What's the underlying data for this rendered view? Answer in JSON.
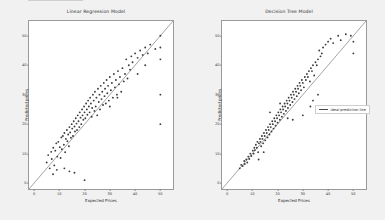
{
  "figure": {
    "background_color": "#f1f1f1",
    "axes_background": "#ffffff",
    "marker_color": "#3b3b3b",
    "line_color": "#555555"
  },
  "panels": [
    {
      "id": "linear-regression",
      "title": "Linear Regression Model",
      "legend_label": "ideal prediction line",
      "legend_position": "upper left"
    },
    {
      "id": "decision-tree",
      "title": "Decision Tree Model",
      "legend_label": "ideal prediction line",
      "legend_position": "center right"
    }
  ],
  "chart_data": [
    {
      "type": "scatter",
      "title": "Linear Regression Model",
      "xlabel": "Expected Prices",
      "ylabel": "Predicted prices",
      "xlim": [
        -2,
        55
      ],
      "ylim": [
        -2,
        55
      ],
      "xticks": [
        0,
        10,
        20,
        30,
        40,
        50
      ],
      "yticks": [
        0,
        10,
        20,
        30,
        40,
        50
      ],
      "grid": false,
      "legend": [
        "ideal prediction line"
      ],
      "legend_position": "upper left",
      "reference_line": {
        "slope": 1,
        "intercept": 0,
        "label": "ideal prediction line"
      },
      "points": [
        [
          5.0,
          7.0
        ],
        [
          5.6,
          9.5
        ],
        [
          6.2,
          5.0
        ],
        [
          6.8,
          10.6
        ],
        [
          7.0,
          8.2
        ],
        [
          7.6,
          12.0
        ],
        [
          8.0,
          6.0
        ],
        [
          8.4,
          11.0
        ],
        [
          8.8,
          13.5
        ],
        [
          9.2,
          9.0
        ],
        [
          9.6,
          14.0
        ],
        [
          10.2,
          12.2
        ],
        [
          10.5,
          8.5
        ],
        [
          10.8,
          15.5
        ],
        [
          11.0,
          11.5
        ],
        [
          11.4,
          16.0
        ],
        [
          11.8,
          13.0
        ],
        [
          12.0,
          17.0
        ],
        [
          12.3,
          10.5
        ],
        [
          12.6,
          15.0
        ],
        [
          13.0,
          18.0
        ],
        [
          13.2,
          14.2
        ],
        [
          13.5,
          16.5
        ],
        [
          13.8,
          12.5
        ],
        [
          14.0,
          19.0
        ],
        [
          14.3,
          17.2
        ],
        [
          14.6,
          15.4
        ],
        [
          14.9,
          20.0
        ],
        [
          15.1,
          18.5
        ],
        [
          15.4,
          16.0
        ],
        [
          15.7,
          21.0
        ],
        [
          16.0,
          19.2
        ],
        [
          16.2,
          17.5
        ],
        [
          16.5,
          22.0
        ],
        [
          16.8,
          20.2
        ],
        [
          17.0,
          18.0
        ],
        [
          17.3,
          23.0
        ],
        [
          17.6,
          21.0
        ],
        [
          17.9,
          19.0
        ],
        [
          18.1,
          24.0
        ],
        [
          18.4,
          22.2
        ],
        [
          18.7,
          20.0
        ],
        [
          19.0,
          25.0
        ],
        [
          19.2,
          23.0
        ],
        [
          19.5,
          21.5
        ],
        [
          19.8,
          26.0
        ],
        [
          20.0,
          24.0
        ],
        [
          20.3,
          22.0
        ],
        [
          20.6,
          27.0
        ],
        [
          20.9,
          25.0
        ],
        [
          21.1,
          23.2
        ],
        [
          21.4,
          28.0
        ],
        [
          21.7,
          26.0
        ],
        [
          22.0,
          24.0
        ],
        [
          22.2,
          29.0
        ],
        [
          22.5,
          27.0
        ],
        [
          22.8,
          22.5
        ],
        [
          23.0,
          25.5
        ],
        [
          23.3,
          30.0
        ],
        [
          23.6,
          28.0
        ],
        [
          23.9,
          24.5
        ],
        [
          24.1,
          31.0
        ],
        [
          24.4,
          26.0
        ],
        [
          24.7,
          29.0
        ],
        [
          25.0,
          23.0
        ],
        [
          25.3,
          32.0
        ],
        [
          25.6,
          27.5
        ],
        [
          25.9,
          30.0
        ],
        [
          26.1,
          25.0
        ],
        [
          26.4,
          33.0
        ],
        [
          26.7,
          28.5
        ],
        [
          27.0,
          31.0
        ],
        [
          27.3,
          26.5
        ],
        [
          27.6,
          34.0
        ],
        [
          27.9,
          29.5
        ],
        [
          28.1,
          32.0
        ],
        [
          28.4,
          27.0
        ],
        [
          28.7,
          35.0
        ],
        [
          29.0,
          30.5
        ],
        [
          29.3,
          33.0
        ],
        [
          29.6,
          28.0
        ],
        [
          30.0,
          36.0
        ],
        [
          30.4,
          31.5
        ],
        [
          30.8,
          34.0
        ],
        [
          31.2,
          29.0
        ],
        [
          31.6,
          37.0
        ],
        [
          32.0,
          32.5
        ],
        [
          32.4,
          35.0
        ],
        [
          32.8,
          30.0
        ],
        [
          33.2,
          38.0
        ],
        [
          33.6,
          33.5
        ],
        [
          34.0,
          36.0
        ],
        [
          34.5,
          31.0
        ],
        [
          35.0,
          39.0
        ],
        [
          35.5,
          34.5
        ],
        [
          36.0,
          37.0
        ],
        [
          36.5,
          42.0
        ],
        [
          37.0,
          35.5
        ],
        [
          37.5,
          40.0
        ],
        [
          38.0,
          38.5
        ],
        [
          38.5,
          43.0
        ],
        [
          39.0,
          41.0
        ],
        [
          40.0,
          44.0
        ],
        [
          41.0,
          42.5
        ],
        [
          42.0,
          45.0
        ],
        [
          43.0,
          43.5
        ],
        [
          44.0,
          46.0
        ],
        [
          45.0,
          44.0
        ],
        [
          46.0,
          47.0
        ],
        [
          48.0,
          45.5
        ],
        [
          50.0,
          50.0
        ],
        [
          50.0,
          46.0
        ],
        [
          50.0,
          42.0
        ],
        [
          50.0,
          30.0
        ],
        [
          50.0,
          20.0
        ],
        [
          12.0,
          5.0
        ],
        [
          14.0,
          4.0
        ],
        [
          16.0,
          3.5
        ],
        [
          20.0,
          1.0
        ],
        [
          7.5,
          3.0
        ],
        [
          9.0,
          4.5
        ],
        [
          30.0,
          26.0
        ],
        [
          33.0,
          29.0
        ],
        [
          41.0,
          37.0
        ],
        [
          44.0,
          40.0
        ]
      ]
    },
    {
      "type": "scatter",
      "title": "Decision Tree Model",
      "xlabel": "Expected Prices",
      "ylabel": "Predicted prices",
      "xlim": [
        -2,
        55
      ],
      "ylim": [
        -2,
        55
      ],
      "xticks": [
        0,
        10,
        20,
        30,
        40,
        50
      ],
      "yticks": [
        0,
        10,
        20,
        30,
        40,
        50
      ],
      "grid": false,
      "legend": [
        "ideal prediction line"
      ],
      "legend_position": "center right",
      "reference_line": {
        "slope": 1,
        "intercept": 0,
        "label": "ideal prediction line"
      },
      "points": [
        [
          5.0,
          5.0
        ],
        [
          5.6,
          6.2
        ],
        [
          6.2,
          5.8
        ],
        [
          6.8,
          7.5
        ],
        [
          7.0,
          6.5
        ],
        [
          7.6,
          8.0
        ],
        [
          8.0,
          7.0
        ],
        [
          8.4,
          9.0
        ],
        [
          8.8,
          8.2
        ],
        [
          9.2,
          10.0
        ],
        [
          9.6,
          9.2
        ],
        [
          10.2,
          11.0
        ],
        [
          10.5,
          10.0
        ],
        [
          10.8,
          12.0
        ],
        [
          11.0,
          11.2
        ],
        [
          11.4,
          13.0
        ],
        [
          11.8,
          12.0
        ],
        [
          12.0,
          14.0
        ],
        [
          12.3,
          10.5
        ],
        [
          12.6,
          13.5
        ],
        [
          13.0,
          15.0
        ],
        [
          13.2,
          14.0
        ],
        [
          13.5,
          12.5
        ],
        [
          13.8,
          16.0
        ],
        [
          14.0,
          15.0
        ],
        [
          14.3,
          13.5
        ],
        [
          14.6,
          17.0
        ],
        [
          14.9,
          16.0
        ],
        [
          15.1,
          14.5
        ],
        [
          15.4,
          18.0
        ],
        [
          15.7,
          17.0
        ],
        [
          16.0,
          15.5
        ],
        [
          16.2,
          19.0
        ],
        [
          16.5,
          18.0
        ],
        [
          16.8,
          16.5
        ],
        [
          17.0,
          20.0
        ],
        [
          17.3,
          19.0
        ],
        [
          17.6,
          17.5
        ],
        [
          17.9,
          21.0
        ],
        [
          18.1,
          20.0
        ],
        [
          18.4,
          18.5
        ],
        [
          18.7,
          22.0
        ],
        [
          19.0,
          21.0
        ],
        [
          19.2,
          19.5
        ],
        [
          19.5,
          23.0
        ],
        [
          19.8,
          22.0
        ],
        [
          20.0,
          20.5
        ],
        [
          20.3,
          24.0
        ],
        [
          20.6,
          23.0
        ],
        [
          20.9,
          21.5
        ],
        [
          21.1,
          25.0
        ],
        [
          21.4,
          24.0
        ],
        [
          21.7,
          22.5
        ],
        [
          22.0,
          26.0
        ],
        [
          22.2,
          25.0
        ],
        [
          22.5,
          23.5
        ],
        [
          22.8,
          27.0
        ],
        [
          23.0,
          26.0
        ],
        [
          23.3,
          24.5
        ],
        [
          23.6,
          28.0
        ],
        [
          23.9,
          27.0
        ],
        [
          24.1,
          25.5
        ],
        [
          24.4,
          29.0
        ],
        [
          24.7,
          28.0
        ],
        [
          25.0,
          26.5
        ],
        [
          25.3,
          30.0
        ],
        [
          25.6,
          29.0
        ],
        [
          25.9,
          27.5
        ],
        [
          26.1,
          31.0
        ],
        [
          26.4,
          30.0
        ],
        [
          26.7,
          28.5
        ],
        [
          27.0,
          32.0
        ],
        [
          27.3,
          31.0
        ],
        [
          27.6,
          29.5
        ],
        [
          27.9,
          33.0
        ],
        [
          28.1,
          32.0
        ],
        [
          28.4,
          30.5
        ],
        [
          28.7,
          34.0
        ],
        [
          29.0,
          33.0
        ],
        [
          29.3,
          31.5
        ],
        [
          29.6,
          35.0
        ],
        [
          30.0,
          34.0
        ],
        [
          30.4,
          32.5
        ],
        [
          30.8,
          36.0
        ],
        [
          31.2,
          35.0
        ],
        [
          31.6,
          37.0
        ],
        [
          32.0,
          36.0
        ],
        [
          32.4,
          38.0
        ],
        [
          32.8,
          34.5
        ],
        [
          33.2,
          39.0
        ],
        [
          33.6,
          38.0
        ],
        [
          34.0,
          40.0
        ],
        [
          34.5,
          36.5
        ],
        [
          35.0,
          41.0
        ],
        [
          35.5,
          40.0
        ],
        [
          36.0,
          42.0
        ],
        [
          36.5,
          45.0
        ],
        [
          37.0,
          43.0
        ],
        [
          37.5,
          44.0
        ],
        [
          38.0,
          46.0
        ],
        [
          39.0,
          47.0
        ],
        [
          40.0,
          48.0
        ],
        [
          41.0,
          49.0
        ],
        [
          42.0,
          47.5
        ],
        [
          44.0,
          50.0
        ],
        [
          45.0,
          48.5
        ],
        [
          47.0,
          50.5
        ],
        [
          49.0,
          50.0
        ],
        [
          50.0,
          48.0
        ],
        [
          50.0,
          44.0
        ],
        [
          34.0,
          28.0
        ],
        [
          36.0,
          30.0
        ],
        [
          33.0,
          26.0
        ],
        [
          30.0,
          23.0
        ],
        [
          17.0,
          24.0
        ],
        [
          21.0,
          27.0
        ],
        [
          24.0,
          22.0
        ],
        [
          26.0,
          21.5
        ],
        [
          12.5,
          8.0
        ],
        [
          14.5,
          10.5
        ]
      ]
    }
  ]
}
